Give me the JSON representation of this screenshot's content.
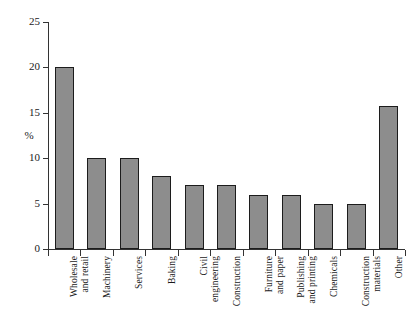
{
  "chart_data": {
    "type": "bar",
    "title": "",
    "xlabel": "",
    "ylabel": "%",
    "ylim": [
      0,
      25
    ],
    "yticks": [
      0,
      5,
      10,
      15,
      20,
      25
    ],
    "ytick_labels": [
      "0",
      "5",
      "10",
      "15",
      "20",
      "25"
    ],
    "grid": false,
    "legend": "none",
    "categories": [
      "Wholesale\nand retail",
      "Machinery",
      "Services",
      "Baking",
      "Civil\nengineering",
      "Construction",
      "Furniture\nand paper",
      "Publishing\nand printing",
      "Chemicals",
      "Construction\nmaterials",
      "Other"
    ],
    "values": [
      20,
      10,
      10,
      8,
      7,
      7,
      6,
      6,
      5,
      5,
      15.7
    ],
    "bar_fill_color": "#8d8d8d",
    "bar_edge_color": "#1c1c1c",
    "axis_color": "#333333"
  }
}
